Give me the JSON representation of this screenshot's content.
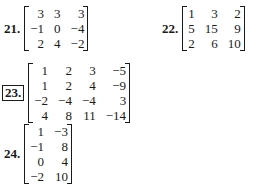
{
  "problems": [
    {
      "number": "21.",
      "boxed": false,
      "rows": [
        [
          "3",
          "3",
          "3"
        ],
        [
          "−1",
          "0",
          "−4"
        ],
        [
          "2",
          "4",
          "−2"
        ]
      ]
    },
    {
      "number": "22.",
      "boxed": false,
      "rows": [
        [
          "1",
          "3",
          "2"
        ],
        [
          "5",
          "15",
          "9"
        ],
        [
          "2",
          "6",
          "10"
        ]
      ]
    },
    {
      "number": "23.",
      "boxed": true,
      "rows": [
        [
          "1",
          "2",
          "3",
          "−5"
        ],
        [
          "1",
          "2",
          "4",
          "−9"
        ],
        [
          "−2",
          "−4",
          "−4",
          "3"
        ],
        [
          "4",
          "8",
          "11",
          "−14"
        ]
      ]
    },
    {
      "number": "24.",
      "boxed": false,
      "rows": [
        [
          "1",
          "−3"
        ],
        [
          "−1",
          "8"
        ],
        [
          "0",
          "4"
        ],
        [
          "−2",
          "10"
        ]
      ]
    }
  ]
}
